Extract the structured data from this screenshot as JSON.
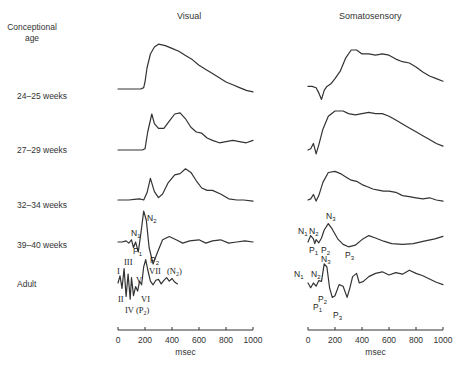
{
  "header": {
    "row_axis_title": "Conceptional age",
    "columns": [
      "Visual",
      "Somatosensory"
    ]
  },
  "rows": [
    {
      "label": "24–25 weeks"
    },
    {
      "label": "27–29 weeks"
    },
    {
      "label": "32–34 weeks"
    },
    {
      "label": "39–40 weeks"
    },
    {
      "label": "Adult"
    }
  ],
  "chart_data": {
    "type": "line",
    "xlabel": "msec",
    "xlim": [
      0,
      1000
    ],
    "x_ticks": [
      0,
      200,
      400,
      600,
      800,
      1000
    ],
    "y_units": "relative amplitude (upward = negative)",
    "panels": [
      {
        "name": "Visual",
        "series": [
          {
            "name": "24–25 weeks",
            "x": [
              0,
              100,
              170,
              190,
              200,
              215,
              240,
              270,
              300,
              350,
              400,
              450,
              500,
              550,
              600,
              650,
              700,
              750,
              800,
              850,
              900,
              950,
              1000
            ],
            "y": [
              0,
              0,
              0,
              0.1,
              0.5,
              1.5,
              2.5,
              3.0,
              3.2,
              3.1,
              2.9,
              2.7,
              2.4,
              2.1,
              1.7,
              1.4,
              1.1,
              0.8,
              0.5,
              0.3,
              0.1,
              -0.1,
              -0.2
            ]
          },
          {
            "name": "27–29 weeks",
            "x": [
              0,
              100,
              180,
              200,
              220,
              250,
              270,
              300,
              340,
              380,
              420,
              460,
              500,
              540,
              580,
              620,
              660,
              700,
              750,
              800,
              850,
              900,
              950,
              1000
            ],
            "y": [
              0,
              0,
              0,
              0.1,
              1.5,
              3.0,
              2.2,
              1.8,
              1.8,
              2.4,
              3.0,
              3.1,
              2.6,
              1.9,
              1.5,
              1.4,
              1.0,
              0.8,
              0.6,
              0.7,
              0.8,
              0.7,
              0.6,
              0.8
            ]
          },
          {
            "name": "32–34 weeks",
            "x": [
              0,
              80,
              120,
              160,
              190,
              215,
              240,
              270,
              300,
              330,
              370,
              420,
              460,
              500,
              540,
              580,
              620,
              660,
              700,
              760,
              820,
              880,
              930,
              1000
            ],
            "y": [
              0,
              0,
              0.05,
              0.1,
              0,
              0.6,
              1.8,
              0.7,
              0.2,
              0.5,
              1.4,
              2.1,
              2.2,
              2.6,
              2.3,
              1.6,
              1.0,
              0.8,
              0.8,
              0.5,
              0.1,
              0,
              0,
              -0.1
            ]
          },
          {
            "name": "39–40 weeks",
            "x": [
              0,
              30,
              60,
              80,
              100,
              115,
              130,
              150,
              170,
              190,
              210,
              230,
              260,
              290,
              330,
              380,
              430,
              480,
              530,
              600,
              650,
              700,
              760,
              820,
              880,
              940,
              1000
            ],
            "y": [
              0,
              0,
              0.1,
              -0.1,
              0.2,
              -0.5,
              0,
              -0.9,
              0.8,
              2.8,
              2.0,
              -0.5,
              -2.0,
              -1.0,
              0.2,
              0.5,
              0.2,
              -0.1,
              0.1,
              0.2,
              -0.1,
              0.1,
              0.2,
              -0.1,
              0,
              0.1,
              0
            ]
          },
          {
            "name": "Adult",
            "x": [
              0,
              15,
              30,
              45,
              60,
              75,
              90,
              100,
              115,
              130,
              145,
              160,
              175,
              190,
              205,
              220,
              240,
              260,
              280,
              300,
              320,
              340,
              360,
              380,
              400,
              420,
              440
            ],
            "y": [
              0,
              0.8,
              -0.6,
              1.6,
              -1.5,
              1.0,
              -1.8,
              0.6,
              -1.4,
              -0.4,
              -0.9,
              0.2,
              -0.2,
              1.8,
              2.6,
              1.5,
              0.2,
              -0.2,
              0.3,
              0.4,
              -0.1,
              0.3,
              0.6,
              0.2,
              0.5,
              0.1,
              -0.1
            ]
          }
        ],
        "peak_labels": [
          {
            "series": "39–40 weeks",
            "labels": [
              "N1",
              "P1",
              "N2",
              "P2"
            ]
          },
          {
            "series": "Adult",
            "labels": [
              "I",
              "II",
              "III",
              "IV (P2)",
              "V",
              "VI",
              "VII",
              "(N2)"
            ]
          }
        ]
      },
      {
        "name": "Somatosensory",
        "series": [
          {
            "name": "24–25 weeks",
            "x": [
              0,
              30,
              60,
              80,
              100,
              120,
              140,
              170,
              200,
              240,
              280,
              320,
              360,
              400,
              450,
              500,
              550,
              600,
              650,
              700,
              750,
              800,
              850,
              900,
              950,
              1000
            ],
            "y": [
              0.2,
              0.2,
              0.1,
              -0.3,
              -0.8,
              -0.1,
              0.2,
              0.4,
              0.8,
              1.4,
              2.4,
              3.0,
              3.0,
              2.7,
              2.7,
              2.6,
              2.7,
              2.6,
              2.3,
              2.1,
              2.0,
              1.7,
              1.3,
              1.0,
              0.8,
              0.6
            ]
          },
          {
            "name": "27–29 weeks",
            "x": [
              0,
              20,
              40,
              50,
              60,
              80,
              110,
              150,
              200,
              260,
              300,
              350,
              400,
              450,
              500,
              550,
              600,
              650,
              700,
              750,
              800,
              850,
              900,
              950,
              1000
            ],
            "y": [
              0,
              0.1,
              0.5,
              0.1,
              -0.3,
              0.4,
              1.6,
              2.6,
              3.0,
              3.0,
              2.8,
              2.7,
              2.8,
              2.9,
              2.8,
              2.8,
              2.6,
              2.3,
              2.0,
              1.7,
              1.4,
              1.1,
              0.8,
              0.5,
              0.3
            ]
          },
          {
            "name": "32–34 weeks",
            "x": [
              0,
              20,
              40,
              50,
              60,
              80,
              110,
              150,
              200,
              240,
              280,
              320,
              360,
              400,
              440,
              480,
              520,
              560,
              600,
              650,
              700,
              750,
              800,
              850,
              900,
              950,
              1000
            ],
            "y": [
              0,
              0.1,
              0.5,
              0.2,
              -0.1,
              0.4,
              1.6,
              2.5,
              2.6,
              2.4,
              2.1,
              1.8,
              1.7,
              1.4,
              1.2,
              1.0,
              0.9,
              0.8,
              0.8,
              0.7,
              0.4,
              0.3,
              0.2,
              0.1,
              0.2,
              0,
              -0.1
            ]
          },
          {
            "name": "39–40 weeks",
            "x": [
              0,
              20,
              40,
              50,
              60,
              80,
              100,
              120,
              150,
              180,
              220,
              260,
              300,
              350,
              400,
              450,
              500,
              560,
              620,
              700,
              780,
              860,
              940,
              1000
            ],
            "y": [
              0,
              0.8,
              0.4,
              -0.2,
              0.3,
              -0.1,
              0.5,
              1.5,
              2.3,
              1.6,
              0.4,
              -0.3,
              -0.6,
              -0.4,
              0.3,
              0.8,
              0.5,
              0.1,
              -0.2,
              -0.3,
              -0.2,
              0.1,
              0.4,
              0.7
            ]
          },
          {
            "name": "Adult",
            "x": [
              0,
              20,
              40,
              60,
              80,
              100,
              120,
              140,
              160,
              180,
              200,
              230,
              260,
              290,
              310,
              330,
              360,
              380,
              410,
              450,
              500,
              550,
              600,
              650,
              700,
              750,
              800,
              850,
              900,
              950,
              1000
            ],
            "y": [
              0,
              -0.6,
              0,
              -0.4,
              0.3,
              0.2,
              2.4,
              2.0,
              -0.6,
              -1.8,
              -1.6,
              -0.2,
              -0.4,
              -1.8,
              -0.6,
              0.8,
              1.2,
              0,
              0.2,
              0.8,
              1.2,
              1.4,
              1.0,
              1.3,
              1.1,
              1.6,
              1.2,
              0.9,
              0.5,
              0.1,
              -0.2
            ]
          }
        ],
        "peak_labels": [
          {
            "series": "39–40 weeks",
            "labels": [
              "N1",
              "P1",
              "N2",
              "P2",
              "N3",
              "P3"
            ]
          },
          {
            "series": "Adult",
            "labels": [
              "N1",
              "P1",
              "N2",
              "P2",
              "N3",
              "P3"
            ]
          }
        ]
      }
    ]
  }
}
